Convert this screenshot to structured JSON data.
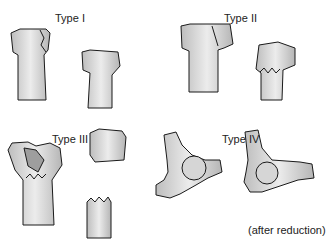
{
  "panels": [
    {
      "id": "type1",
      "label": "Type I"
    },
    {
      "id": "type2",
      "label": "Type II"
    },
    {
      "id": "type3",
      "label": "Type III"
    },
    {
      "id": "type4",
      "label": "Type IV",
      "caption": "(after reduction)"
    }
  ],
  "colors": {
    "bone_fill": "#cfcfcf",
    "bone_light": "#e6e6e6",
    "outline": "#1a1a1a"
  }
}
